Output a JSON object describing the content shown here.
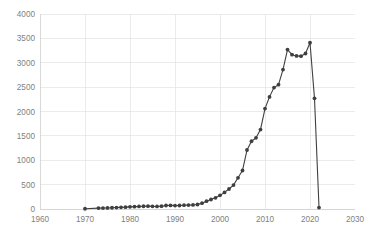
{
  "chart_data": {
    "type": "line",
    "title": "",
    "subtitle": "",
    "xlabel": "",
    "ylabel": "",
    "xlim": [
      1960,
      2030
    ],
    "ylim": [
      0,
      4000
    ],
    "grid": true,
    "legend": false,
    "legend_position": "none",
    "marker": "filled-circle",
    "line_color": "#404040",
    "marker_color": "#3f3f3f",
    "gridline_color": "#e3e3e3",
    "tick_label_color": "#7f7f7f",
    "xticks": [
      1960,
      1970,
      1980,
      1990,
      2000,
      2010,
      2020,
      2030
    ],
    "xtick_labels": [
      "1960",
      "1970",
      "1980",
      "1990",
      "2000",
      "2010",
      "2020",
      "2030"
    ],
    "yticks": [
      0,
      500,
      1000,
      1500,
      2000,
      2500,
      3000,
      3500,
      4000
    ],
    "ytick_labels": [
      "0",
      "500",
      "1000",
      "1500",
      "2000",
      "2500",
      "3000",
      "3500",
      "4000"
    ],
    "x": [
      1970,
      1973,
      1974,
      1975,
      1976,
      1977,
      1978,
      1979,
      1980,
      1981,
      1982,
      1983,
      1984,
      1985,
      1986,
      1987,
      1988,
      1989,
      1990,
      1991,
      1992,
      1993,
      1994,
      1995,
      1996,
      1997,
      1998,
      1999,
      2000,
      2001,
      2002,
      2003,
      2004,
      2005,
      2006,
      2007,
      2008,
      2009,
      2010,
      2011,
      2012,
      2013,
      2014,
      2015,
      2016,
      2017,
      2018,
      2019,
      2020
    ],
    "values": [
      5,
      18,
      20,
      22,
      26,
      30,
      34,
      38,
      44,
      48,
      50,
      54,
      56,
      52,
      50,
      56,
      66,
      68,
      64,
      66,
      70,
      72,
      74,
      80,
      110,
      150,
      185,
      220,
      270,
      330,
      400,
      480,
      620,
      790,
      1200,
      1380,
      1450,
      1620,
      2050,
      2290,
      2480,
      2540,
      2850,
      3270,
      3160,
      3140,
      3130,
      3180,
      3410
    ],
    "series": [
      {
        "name": "series-1",
        "points": [
          {
            "x": 1970,
            "y": 5
          },
          {
            "x": 1973,
            "y": 18
          },
          {
            "x": 1974,
            "y": 20
          },
          {
            "x": 1975,
            "y": 22
          },
          {
            "x": 1976,
            "y": 26
          },
          {
            "x": 1977,
            "y": 30
          },
          {
            "x": 1978,
            "y": 34
          },
          {
            "x": 1979,
            "y": 38
          },
          {
            "x": 1980,
            "y": 44
          },
          {
            "x": 1981,
            "y": 48
          },
          {
            "x": 1982,
            "y": 52
          },
          {
            "x": 1983,
            "y": 56
          },
          {
            "x": 1984,
            "y": 58
          },
          {
            "x": 1985,
            "y": 54
          },
          {
            "x": 1986,
            "y": 52
          },
          {
            "x": 1987,
            "y": 58
          },
          {
            "x": 1988,
            "y": 72
          },
          {
            "x": 1989,
            "y": 74
          },
          {
            "x": 1990,
            "y": 70
          },
          {
            "x": 1991,
            "y": 72
          },
          {
            "x": 1992,
            "y": 78
          },
          {
            "x": 1993,
            "y": 80
          },
          {
            "x": 1994,
            "y": 84
          },
          {
            "x": 1995,
            "y": 92
          },
          {
            "x": 1996,
            "y": 120
          },
          {
            "x": 1997,
            "y": 160
          },
          {
            "x": 1998,
            "y": 195
          },
          {
            "x": 1999,
            "y": 230
          },
          {
            "x": 2000,
            "y": 280
          },
          {
            "x": 2001,
            "y": 340
          },
          {
            "x": 2002,
            "y": 410
          },
          {
            "x": 2003,
            "y": 490
          },
          {
            "x": 2004,
            "y": 640
          },
          {
            "x": 2005,
            "y": 790
          },
          {
            "x": 2006,
            "y": 1210
          },
          {
            "x": 2007,
            "y": 1390
          },
          {
            "x": 2008,
            "y": 1460
          },
          {
            "x": 2009,
            "y": 1630
          },
          {
            "x": 2010,
            "y": 2060
          },
          {
            "x": 2011,
            "y": 2300
          },
          {
            "x": 2012,
            "y": 2490
          },
          {
            "x": 2013,
            "y": 2550
          },
          {
            "x": 2014,
            "y": 2860
          },
          {
            "x": 2015,
            "y": 3270
          },
          {
            "x": 2016,
            "y": 3165
          },
          {
            "x": 2017,
            "y": 3140
          },
          {
            "x": 2018,
            "y": 3135
          },
          {
            "x": 2019,
            "y": 3190
          },
          {
            "x": 2020,
            "y": 3410
          },
          {
            "x": 2021,
            "y": 2270
          },
          {
            "x": 2022,
            "y": 30
          }
        ]
      }
    ],
    "annotations": []
  }
}
